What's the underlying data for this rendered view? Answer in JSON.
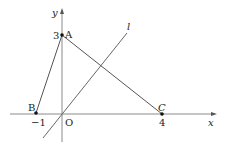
{
  "diagram": {
    "axes": {
      "x_label": "x",
      "y_label": "y",
      "origin_label": "O"
    },
    "points": {
      "A": {
        "label": "A",
        "coord": [
          0,
          3
        ],
        "tick_label": "3"
      },
      "B": {
        "label": "B",
        "coord": [
          -1,
          0
        ],
        "tick_label": "−1"
      },
      "C": {
        "label": "C",
        "coord": [
          4,
          0
        ],
        "tick_label": "4"
      }
    },
    "line": {
      "label": "l"
    },
    "colors": {
      "axis": "#8a8a8a",
      "segment": "#555555",
      "point": "#111111"
    }
  }
}
